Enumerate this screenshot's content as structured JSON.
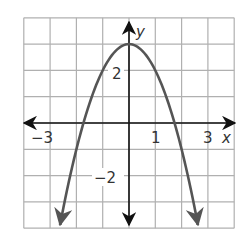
{
  "chart_data": {
    "type": "line",
    "title": "",
    "xlabel": "x",
    "ylabel": "y",
    "xlim": [
      -4,
      4
    ],
    "ylim": [
      -4,
      4
    ],
    "grid": true,
    "x_ticks_labeled": [
      {
        "value": -3,
        "label": "−3"
      },
      {
        "value": 1,
        "label": "1"
      },
      {
        "value": 3,
        "label": "3"
      }
    ],
    "y_ticks_labeled": [
      {
        "value": 2,
        "label": "2"
      },
      {
        "value": -2,
        "label": "−2"
      }
    ],
    "series": [
      {
        "name": "parabola",
        "equation": "y = 3 - x^2",
        "vertex": [
          0,
          3
        ],
        "x_intercepts": [
          -1.73,
          1.73
        ],
        "x": [
          -2.62,
          -2,
          -1.73,
          -1,
          0,
          1,
          1.73,
          2,
          2.62
        ],
        "values": [
          -3.86,
          -1,
          0,
          2,
          3,
          2,
          0,
          -1,
          -3.86
        ],
        "color": "#555555",
        "arrows_at_ends": true
      }
    ]
  },
  "labels": {
    "x_axis": "x",
    "y_axis": "y",
    "tick_neg3": "−3",
    "tick_1": "1",
    "tick_3": "3",
    "tick_2": "2",
    "tick_neg2": "−2"
  },
  "colors": {
    "grid": "#b0b0b0",
    "axis": "#111111",
    "curve": "#555555"
  }
}
